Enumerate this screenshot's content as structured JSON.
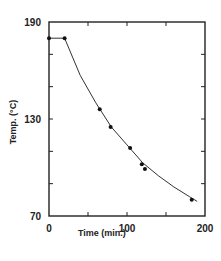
{
  "chart_data": {
    "type": "line",
    "title": "",
    "xlabel": "Time    (min.)",
    "ylabel": "Temp.  (°C)",
    "xlim": [
      0,
      200
    ],
    "ylim": [
      70,
      190
    ],
    "x_ticks": [
      0,
      100,
      200
    ],
    "x_minor_ticks": [
      50,
      150
    ],
    "y_ticks": [
      70,
      130,
      190
    ],
    "y_minor_ticks": [
      90,
      110,
      150,
      170
    ],
    "grid": false,
    "legend": null,
    "series": [
      {
        "name": "measured",
        "style": "markers",
        "x": [
          0,
          20,
          65,
          79,
          104,
          119,
          123,
          183
        ],
        "y": [
          180,
          180,
          136,
          125,
          112,
          102,
          99,
          80
        ]
      },
      {
        "name": "fitted curve",
        "style": "line",
        "x": [
          0,
          20,
          40,
          60,
          80,
          100,
          120,
          140,
          160,
          180,
          190
        ],
        "y": [
          180,
          180,
          157,
          140,
          125,
          114,
          103,
          95,
          88,
          82,
          79
        ]
      }
    ]
  }
}
